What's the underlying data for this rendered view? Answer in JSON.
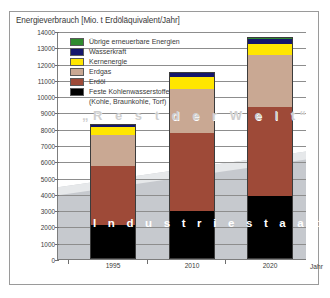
{
  "chart_data": {
    "type": "bar",
    "stacked": true,
    "title": "Energieverbrauch [Mio. t Erdöläquivalent/Jahr]",
    "xlabel": "Jahr",
    "ylabel": "",
    "categories": [
      "1995",
      "2010",
      "2020"
    ],
    "ylim": [
      0,
      14000
    ],
    "ytick_step": 1000,
    "yticks": [
      "14000",
      "13000",
      "12000",
      "11000",
      "10000",
      "9000",
      "8000",
      "7000",
      "6000",
      "5000",
      "4000",
      "3000",
      "2000",
      "1000",
      "0"
    ],
    "grid": true,
    "legend_position": "inside-top-left",
    "series": [
      {
        "name": "Feste Kohlenwasserstoffe",
        "color": "#000000",
        "values": [
          2100,
          2950,
          3900
        ]
      },
      {
        "name": "Erdöl",
        "color": "#9e4a38",
        "values": [
          3600,
          4800,
          5450
        ]
      },
      {
        "name": "Erdgas",
        "color": "#c9a893",
        "values": [
          1900,
          2700,
          3150
        ]
      },
      {
        "name": "Kernenergie",
        "color": "#ffe600",
        "values": [
          500,
          700,
          700
        ]
      },
      {
        "name": "Wasserkraft",
        "color": "#15166b",
        "values": [
          150,
          250,
          300
        ]
      },
      {
        "name": "Übrige erneuerbare Energien",
        "color": "#2f8a2f",
        "values": [
          60,
          80,
          120
        ]
      }
    ],
    "totals": [
      8310,
      11480,
      13620
    ],
    "annotations": [
      "„Rest der Welt“",
      "Industriestaaten"
    ],
    "credit": "Grafik: SCHENK 2000"
  },
  "legend": {
    "items": [
      {
        "label": "Übrige erneuerbare Energien",
        "sublabel": "",
        "color": "#2f8a2f"
      },
      {
        "label": "Wasserkraft",
        "sublabel": "",
        "color": "#15166b"
      },
      {
        "label": "Kernenergie",
        "sublabel": "",
        "color": "#ffe600"
      },
      {
        "label": "Erdgas",
        "sublabel": "",
        "color": "#c9a893"
      },
      {
        "label": "Erdöl",
        "sublabel": "",
        "color": "#9e4a38"
      },
      {
        "label": "Feste Kohlenwasserstoffe",
        "sublabel": "(Kohle, Braunkohle, Torf)",
        "color": "#000000"
      }
    ]
  },
  "annotations": {
    "rest_der_welt": "„R e s t   d e r   W e l t“",
    "industriestaaten": "I n d u s t r i e s t a a t e n",
    "credit": "Grafik: SCHENK 2000"
  },
  "axes": {
    "title": "Energieverbrauch [Mio. t Erdöläquivalent/Jahr]",
    "x_label": "Jahr"
  }
}
